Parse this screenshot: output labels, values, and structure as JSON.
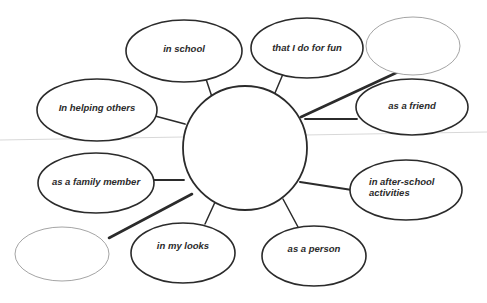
{
  "diagram": {
    "type": "concept-web",
    "title": "",
    "center_node": {
      "id": "center",
      "label": "",
      "cx": 245,
      "cy": 148,
      "rx": 62,
      "ry": 62
    },
    "nodes": [
      {
        "id": "in-school",
        "label": "in school",
        "cx": 184,
        "cy": 51,
        "rx": 58,
        "ry": 31,
        "stroke": "#2b2b2b",
        "stroke_width": 1.6,
        "label_x": 146,
        "label_y": 43,
        "label_w": 76,
        "align": "center",
        "empty": false
      },
      {
        "id": "that-i-do-for-fun",
        "label": "that I do for fun",
        "cx": 307,
        "cy": 48,
        "rx": 56,
        "ry": 30,
        "stroke": "#2b2b2b",
        "stroke_width": 1.6,
        "label_x": 262,
        "label_y": 42,
        "label_w": 90,
        "align": "center",
        "empty": false
      },
      {
        "id": "empty-top-right",
        "label": "",
        "cx": 413,
        "cy": 46,
        "rx": 47,
        "ry": 29,
        "stroke": "#9a9a9a",
        "stroke_width": 0.9,
        "label_x": 371,
        "label_y": 40,
        "label_w": 84,
        "align": "center",
        "empty": true
      },
      {
        "id": "in-helping-others",
        "label": "In helping others",
        "cx": 97,
        "cy": 110,
        "rx": 60,
        "ry": 31,
        "stroke": "#2b2b2b",
        "stroke_width": 1.6,
        "label_x": 48,
        "label_y": 102,
        "label_w": 98,
        "align": "center",
        "empty": false
      },
      {
        "id": "as-a-friend",
        "label": "as a friend",
        "cx": 412,
        "cy": 107,
        "rx": 56,
        "ry": 28,
        "stroke": "#2b2b2b",
        "stroke_width": 1.6,
        "label_x": 370,
        "label_y": 100,
        "label_w": 84,
        "align": "center",
        "empty": false
      },
      {
        "id": "as-a-family-member",
        "label": "as a family member",
        "cx": 96,
        "cy": 183,
        "rx": 58,
        "ry": 30,
        "stroke": "#2b2b2b",
        "stroke_width": 1.6,
        "label_x": 42,
        "label_y": 176,
        "label_w": 108,
        "align": "center",
        "empty": false
      },
      {
        "id": "in-after-school",
        "label": "in after-school\nactivities",
        "cx": 406,
        "cy": 190,
        "rx": 56,
        "ry": 30,
        "stroke": "#2b2b2b",
        "stroke_width": 1.6,
        "label_x": 369,
        "label_y": 176,
        "label_w": 84,
        "align": "left",
        "empty": false
      },
      {
        "id": "empty-bottom-left",
        "label": "",
        "cx": 62,
        "cy": 254,
        "rx": 47,
        "ry": 27,
        "stroke": "#9a9a9a",
        "stroke_width": 0.9,
        "label_x": 20,
        "label_y": 248,
        "label_w": 84,
        "align": "center",
        "empty": true
      },
      {
        "id": "in-my-looks",
        "label": "in my looks",
        "cx": 183,
        "cy": 253,
        "rx": 52,
        "ry": 30,
        "stroke": "#2b2b2b",
        "stroke_width": 1.6,
        "label_x": 142,
        "label_y": 240,
        "label_w": 82,
        "align": "center",
        "empty": false
      },
      {
        "id": "as-a-person",
        "label": "as a person",
        "cx": 314,
        "cy": 256,
        "rx": 52,
        "ry": 30,
        "stroke": "#2b2b2b",
        "stroke_width": 1.6,
        "label_x": 273,
        "label_y": 243,
        "label_w": 82,
        "align": "center",
        "empty": false
      }
    ],
    "connectors": [
      {
        "id": "conn-in-school",
        "from": "center",
        "to": "in-school",
        "x1": 214,
        "y1": 103,
        "x2": 206,
        "y2": 79,
        "width": 1.5
      },
      {
        "id": "conn-that-i-do-for-fun",
        "from": "center",
        "to": "that-i-do-for-fun",
        "x1": 272,
        "y1": 100,
        "x2": 283,
        "y2": 74,
        "width": 1.5
      },
      {
        "id": "conn-empty-top-right",
        "from": "center",
        "to": "empty-top-right",
        "x1": 301,
        "y1": 117,
        "x2": 398,
        "y2": 72,
        "width": 2.6
      },
      {
        "id": "conn-in-helping-others",
        "from": "center",
        "to": "in-helping-others",
        "x1": 185,
        "y1": 124,
        "x2": 155,
        "y2": 116,
        "width": 1.8
      },
      {
        "id": "conn-as-a-friend",
        "from": "center",
        "to": "as-a-friend",
        "x1": 305,
        "y1": 119,
        "x2": 357,
        "y2": 119,
        "width": 1.8
      },
      {
        "id": "conn-as-a-family-member",
        "from": "center",
        "to": "as-a-family-member",
        "x1": 184,
        "y1": 180,
        "x2": 153,
        "y2": 180,
        "width": 1.8
      },
      {
        "id": "conn-in-after-school",
        "from": "center",
        "to": "in-after-school",
        "x1": 300,
        "y1": 182,
        "x2": 352,
        "y2": 190,
        "width": 2.0
      },
      {
        "id": "conn-empty-bottom-left",
        "from": "center",
        "to": "empty-bottom-left",
        "x1": 192,
        "y1": 194,
        "x2": 109,
        "y2": 238,
        "width": 2.6
      },
      {
        "id": "conn-in-my-looks",
        "from": "center",
        "to": "in-my-looks",
        "x1": 216,
        "y1": 200,
        "x2": 205,
        "y2": 224,
        "width": 1.5
      },
      {
        "id": "conn-as-a-person",
        "from": "center",
        "to": "as-a-person",
        "x1": 283,
        "y1": 199,
        "x2": 298,
        "y2": 227,
        "width": 1.5
      }
    ],
    "artifacts": [
      {
        "id": "scan-line",
        "x1": 0,
        "y1": 140,
        "x2": 487,
        "y2": 132,
        "color": "#d8d8d8",
        "width": 1
      }
    ],
    "colors": {
      "background": "#ffffff",
      "ink": "#2b2b2b",
      "faint_ink": "#9a9a9a",
      "artifact": "#d8d8d8"
    }
  }
}
